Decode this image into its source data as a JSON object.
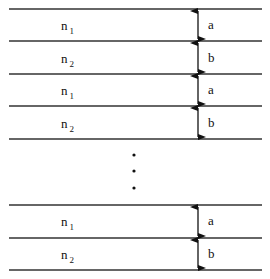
{
  "layers_top": [
    {
      "index_base": "n",
      "index_sub": "1",
      "thickness": "a"
    },
    {
      "index_base": "n",
      "index_sub": "2",
      "thickness": "b"
    },
    {
      "index_base": "n",
      "index_sub": "1",
      "thickness": "a"
    },
    {
      "index_base": "n",
      "index_sub": "2",
      "thickness": "b"
    }
  ],
  "ellipsis": "continuation dots",
  "layers_bottom": [
    {
      "index_base": "n",
      "index_sub": "1",
      "thickness": "a"
    },
    {
      "index_base": "n",
      "index_sub": "2",
      "thickness": "b"
    }
  ]
}
